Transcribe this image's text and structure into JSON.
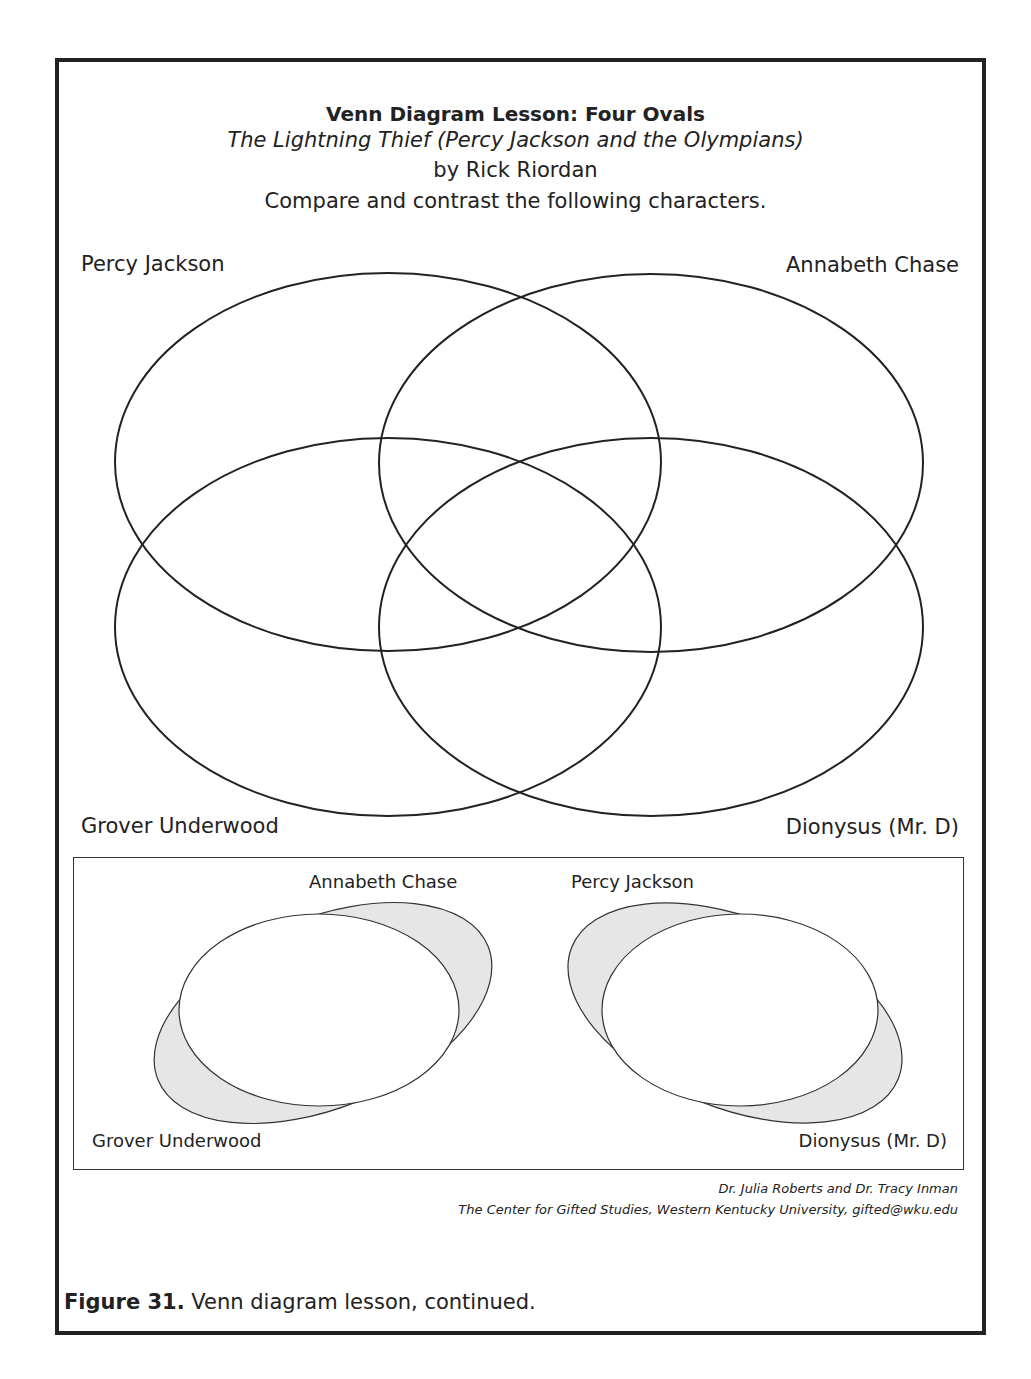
{
  "header": {
    "title": "Venn Diagram Lesson: Four Ovals",
    "book_title": "The Lightning Thief (Percy Jackson and the Olympians)",
    "author": "by Rick Riordan",
    "instructions": "Compare and contrast the following characters."
  },
  "four_oval_diagram": {
    "labels": {
      "top_left": "Percy Jackson",
      "top_right": "Annabeth Chase",
      "bottom_left": "Grover Underwood",
      "bottom_right": "Dionysus (Mr. D)"
    }
  },
  "legend_diagrams": [
    {
      "top_label": "Annabeth Chase",
      "bottom_label": "Grover Underwood"
    },
    {
      "top_label": "Percy Jackson",
      "bottom_label": "Dionysus (Mr. D)"
    }
  ],
  "credits": {
    "line1": "Dr. Julia Roberts and Dr. Tracy Inman",
    "line2": "The Center for Gifted Studies, Western Kentucky University, gifted@wku.edu"
  },
  "caption": {
    "label": "Figure 31.",
    "text": " Venn diagram lesson, continued."
  },
  "colors": {
    "stroke": "#222222",
    "shade": "#e6e6e6"
  }
}
